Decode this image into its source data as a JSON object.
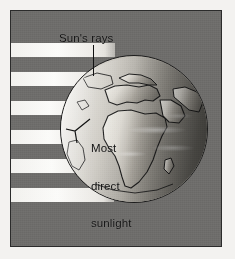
{
  "figure": {
    "kind": "science-illustration",
    "frame_color": "#2b2b2b",
    "background_color": "#6e6d6b",
    "ray_color": "#fbfbf9",
    "label_color": "#111111"
  },
  "labels": {
    "sun_rays": "Sun's rays",
    "most_direct_sunlight_line1": "Most",
    "most_direct_sunlight_line2": "direct",
    "most_direct_sunlight_line3": "sunlight"
  },
  "globe": {
    "name": "earth-globe",
    "visible_region": "Africa, Europe, Middle East",
    "lit_side": "left",
    "center_x": 123,
    "center_y": 118,
    "diameter": 148
  },
  "rays": {
    "count": 6,
    "orientation": "horizontal",
    "tops": [
      44,
      79,
      113,
      147,
      181,
      215
    ],
    "height": 14
  }
}
